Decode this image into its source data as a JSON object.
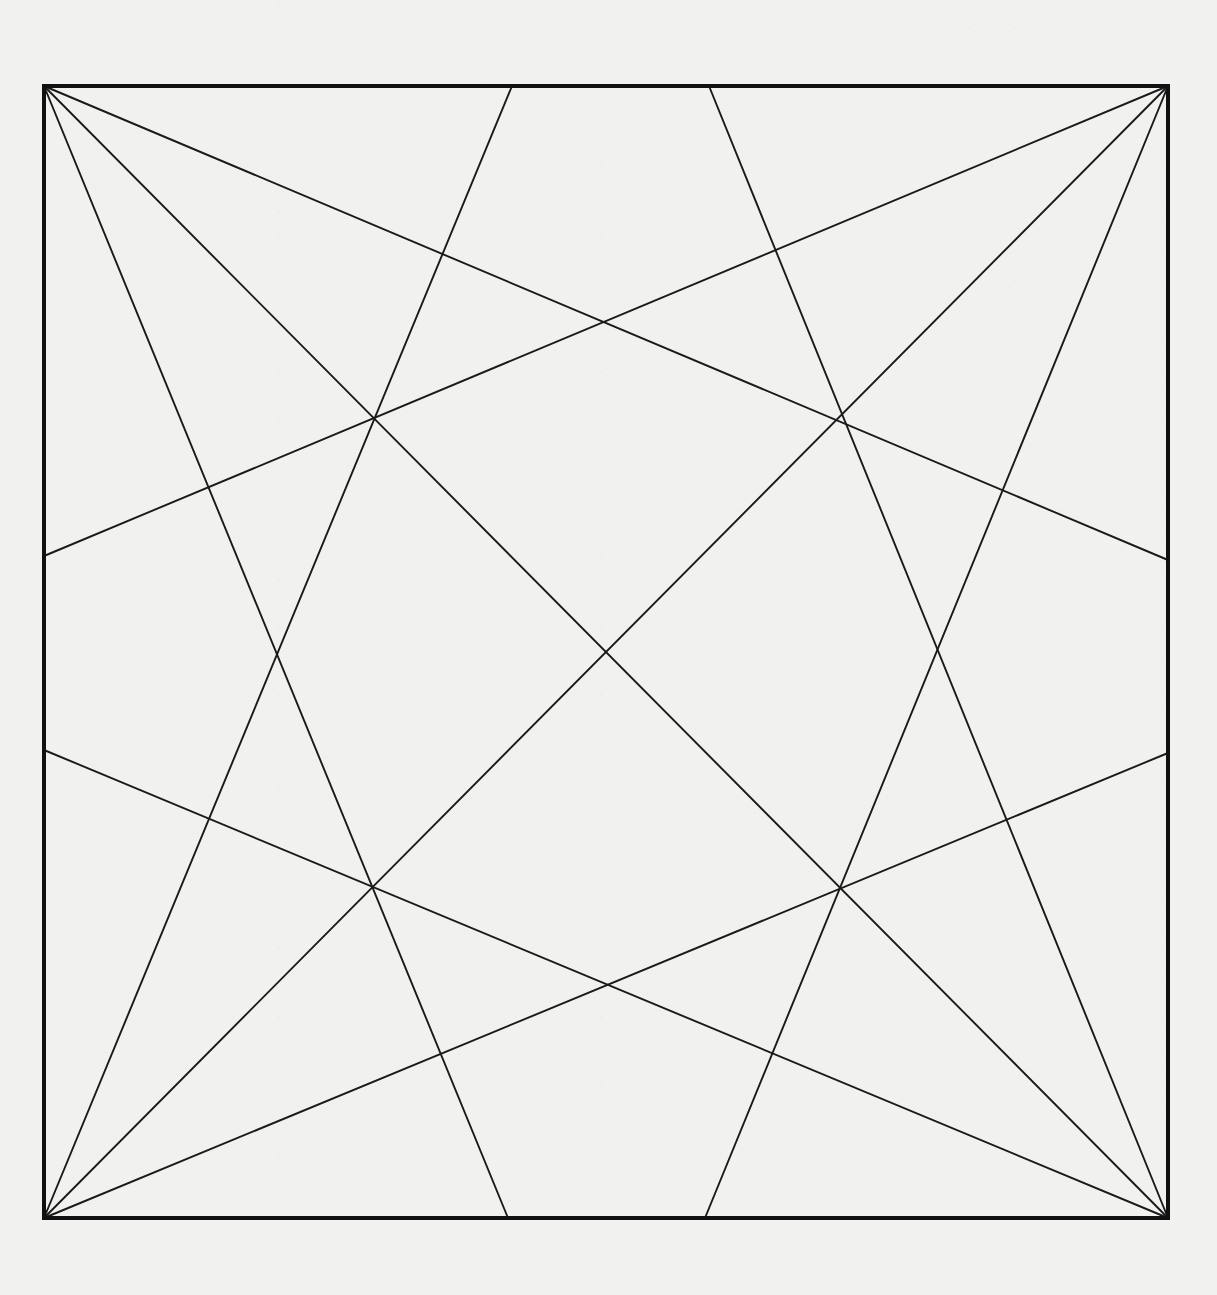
{
  "figure": {
    "title": "Square with corner-to-edge chord construction",
    "type": "line-diagram",
    "canvas": {
      "width": 1217,
      "height": 1295
    },
    "colors": {
      "background": "#f1f1ef",
      "border_stroke": "#111111",
      "line_stroke": "#1a1a1a"
    },
    "stroke_widths": {
      "border": 4.0,
      "chord": 1.9,
      "diagonal": 1.9
    },
    "square": {
      "name": "outer-square",
      "x": 44,
      "y": 86,
      "width": 1124,
      "height": 1132,
      "corners": {
        "top_left": {
          "label": "A",
          "x": 44,
          "y": 86
        },
        "top_right": {
          "label": "B",
          "x": 1168,
          "y": 86
        },
        "bottom_right": {
          "label": "C",
          "x": 1168,
          "y": 1218
        },
        "bottom_left": {
          "label": "D",
          "x": 44,
          "y": 1218
        }
      }
    },
    "edge_points": [
      {
        "name": "top-left-third",
        "edge": "top",
        "x": 512,
        "y": 86
      },
      {
        "name": "top-right-third",
        "edge": "top",
        "x": 709,
        "y": 86
      },
      {
        "name": "bottom-left-third",
        "edge": "bottom",
        "x": 508,
        "y": 1218
      },
      {
        "name": "bottom-right-third",
        "edge": "bottom",
        "x": 705,
        "y": 1218
      },
      {
        "name": "left-upper-third",
        "edge": "left",
        "x": 44,
        "y": 556
      },
      {
        "name": "left-lower-third",
        "edge": "left",
        "x": 44,
        "y": 750
      },
      {
        "name": "right-upper-third",
        "edge": "right",
        "x": 1168,
        "y": 560
      },
      {
        "name": "right-lower-third",
        "edge": "right",
        "x": 1168,
        "y": 753
      }
    ],
    "lines": [
      {
        "name": "chord-tl-to-right-upper",
        "from": "top_left",
        "to": "right-upper-third",
        "x1": 44,
        "y1": 86,
        "x2": 1168,
        "y2": 560
      },
      {
        "name": "chord-tl-to-bottom-left",
        "from": "top_left",
        "to": "bottom-left-third",
        "x1": 44,
        "y1": 86,
        "x2": 508,
        "y2": 1218
      },
      {
        "name": "diagonal-tl-to-br",
        "from": "top_left",
        "to": "bottom_right",
        "x1": 44,
        "y1": 86,
        "x2": 1168,
        "y2": 1218
      },
      {
        "name": "chord-tr-to-left-upper",
        "from": "top_right",
        "to": "left-upper-third",
        "x1": 1168,
        "y1": 86,
        "x2": 44,
        "y2": 556
      },
      {
        "name": "chord-tr-to-bottom-right",
        "from": "top_right",
        "to": "bottom-right-third",
        "x1": 1168,
        "y1": 86,
        "x2": 705,
        "y2": 1218
      },
      {
        "name": "diagonal-tr-to-bl",
        "from": "top_right",
        "to": "bottom_left",
        "x1": 1168,
        "y1": 86,
        "x2": 44,
        "y2": 1218
      },
      {
        "name": "chord-bl-to-right-lower",
        "from": "bottom_left",
        "to": "right-lower-third",
        "x1": 44,
        "y1": 1218,
        "x2": 1168,
        "y2": 753
      },
      {
        "name": "chord-bl-to-top-left",
        "from": "bottom_left",
        "to": "top-left-third",
        "x1": 44,
        "y1": 1218,
        "x2": 512,
        "y2": 86
      },
      {
        "name": "chord-br-to-left-lower",
        "from": "bottom_right",
        "to": "left-lower-third",
        "x1": 1168,
        "y1": 1218,
        "x2": 44,
        "y2": 750
      },
      {
        "name": "chord-br-to-top-right",
        "from": "bottom_right",
        "to": "top-right-third",
        "x1": 1168,
        "y1": 1218,
        "x2": 709,
        "y2": 86
      }
    ],
    "intersection_nodes": [
      {
        "name": "node-upper-left",
        "x": 377,
        "y": 420,
        "degree": 3
      },
      {
        "name": "node-upper-right",
        "x": 838,
        "y": 422,
        "degree": 3
      },
      {
        "name": "node-lower-left",
        "x": 372,
        "y": 884,
        "degree": 3
      },
      {
        "name": "node-lower-right",
        "x": 837,
        "y": 888,
        "degree": 3
      },
      {
        "name": "node-center",
        "x": 607,
        "y": 655,
        "degree": 2
      },
      {
        "name": "node-top-center",
        "x": 605,
        "y": 325,
        "degree": 2
      },
      {
        "name": "node-bottom-center",
        "x": 606,
        "y": 982,
        "degree": 2
      }
    ]
  }
}
